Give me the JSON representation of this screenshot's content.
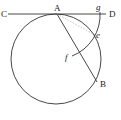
{
  "diagram": {
    "type": "geometry-construction",
    "labels": {
      "C": "C",
      "A": "A",
      "g": "g",
      "D": "D",
      "e": "e",
      "f": "f",
      "B": "B"
    },
    "points": {
      "C": [
        8,
        14
      ],
      "A": [
        57,
        14
      ],
      "g": [
        100,
        14
      ],
      "D": [
        106,
        14
      ],
      "e": [
        95,
        35
      ],
      "f": [
        72,
        56
      ],
      "B": [
        97,
        82
      ]
    },
    "circle": {
      "cx": 56,
      "cy": 59,
      "r": 45
    },
    "arc": {
      "center": "A",
      "from": "g",
      "through": "e",
      "to": "f"
    },
    "colors": {
      "stroke": "#333333",
      "dashed": "#999999",
      "text": "#222222"
    }
  }
}
